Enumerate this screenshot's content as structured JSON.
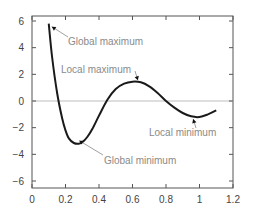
{
  "chart_data": {
    "type": "line",
    "title": "",
    "xlabel": "",
    "ylabel": "",
    "xlim": [
      0,
      1.2
    ],
    "ylim": [
      -6.5,
      6.5
    ],
    "x_ticks": [
      "0",
      "0.2",
      "0.4",
      "0.6",
      "0.8",
      "1",
      "1.2"
    ],
    "y_ticks": [
      "6",
      "4",
      "2",
      "0",
      "-2",
      "-4",
      "-6"
    ],
    "grid": false,
    "zero_line": true,
    "series": [
      {
        "name": "f(x)",
        "x": [
          0.1,
          0.12,
          0.15,
          0.18,
          0.2,
          0.22,
          0.25,
          0.28,
          0.3,
          0.33,
          0.36,
          0.4,
          0.45,
          0.5,
          0.55,
          0.6,
          0.65,
          0.7,
          0.75,
          0.8,
          0.85,
          0.9,
          0.95,
          1.0,
          1.05,
          1.1
        ],
        "values": [
          5.8,
          3.3,
          0.6,
          -1.3,
          -2.2,
          -2.8,
          -3.15,
          -3.2,
          -3.1,
          -2.7,
          -2.1,
          -1.1,
          0.1,
          0.9,
          1.3,
          1.45,
          1.4,
          1.1,
          0.6,
          0.0,
          -0.5,
          -0.9,
          -1.15,
          -1.2,
          -1.0,
          -0.7
        ]
      }
    ],
    "annotations": [
      {
        "text": "Global maximum",
        "point": [
          0.1,
          5.8
        ]
      },
      {
        "text": "Local maximum",
        "point": [
          0.65,
          1.4
        ]
      },
      {
        "text": "Local minimum",
        "point": [
          0.98,
          -1.2
        ]
      },
      {
        "text": "Global minimum",
        "point": [
          0.3,
          -3.2
        ]
      }
    ]
  }
}
